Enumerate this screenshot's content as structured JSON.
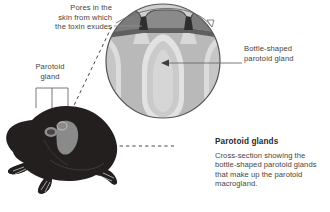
{
  "figure": {
    "title_alt": "Parotoid glands cross-section diagram",
    "labels": {
      "pores": "Pores in the\nskin from which\nthe toxin exudes",
      "pores_line1": "Pores in the",
      "pores_line2": "skin from which",
      "pores_line3": "the toxin exudes",
      "parotoid_line1": "Parotoid",
      "parotoid_line2": "gland",
      "bottle_line1": "Bottle-shaped",
      "bottle_line2": "parotoid gland"
    },
    "caption": {
      "heading": "Parotoid glands",
      "body_line1": "Cross-section showing the",
      "body_line2": "bottle-shaped parotoid glands",
      "body_line3": "that make up the parotoid",
      "body_line4": "macrogland."
    },
    "colors": {
      "background": "#ffffff",
      "text": "#444444",
      "heading": "#2b2b2b",
      "leader_line": "#8f8f8f",
      "circle_outline": "#5a5a5a",
      "skin_dark": "#777777",
      "skin_darker": "#4f4f4f",
      "gland_light": "#d2d2d2",
      "gland_mid": "#b4b4b4",
      "gland_edge": "#e8e8e8",
      "toad_body": "#231f1f",
      "toad_gland_patch": "#8a8a8a",
      "dashed_callout": "#333333"
    },
    "elements": {
      "circle_inset": "magnified circular cross-section",
      "toad": "toad silhouette side view",
      "gland_count": 3,
      "pore_count": 2
    }
  }
}
